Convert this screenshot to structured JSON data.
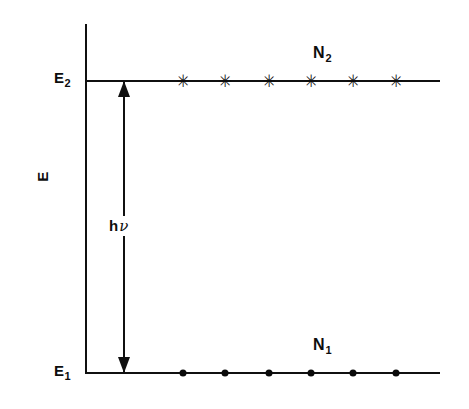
{
  "figure": {
    "background_color": "#ffffff",
    "ink_color": "#101010"
  },
  "axis": {
    "label": "E",
    "name": "energy-axis",
    "orientation": "vertical",
    "top_y": 24,
    "bottom_y": 373,
    "x": 86
  },
  "levels": [
    {
      "id": "upper",
      "level_label": "E",
      "level_subscript": "2",
      "population_label": "N",
      "population_subscript": "2",
      "marker_glyph": "✳",
      "marker_type": "asterisk",
      "y": 81,
      "x_start": 86,
      "x_end": 440,
      "marker_x": [
        183,
        225,
        269,
        311,
        353,
        396
      ]
    },
    {
      "id": "lower",
      "level_label": "E",
      "level_subscript": "1",
      "population_label": "N",
      "population_subscript": "1",
      "marker_glyph": "●",
      "marker_type": "dot",
      "y": 373,
      "x_start": 86,
      "x_end": 440,
      "marker_x": [
        183,
        225,
        269,
        311,
        353,
        396
      ]
    }
  ],
  "transition": {
    "label_h": "h",
    "label_nu": "ν",
    "label_full": "hν",
    "type": "double-headed-arrow",
    "x": 124,
    "from_y": 373,
    "to_y": 81
  },
  "chart_data": {
    "type": "scatter",
    "xlabel": "",
    "ylabel": "E",
    "grid": false,
    "legend": "none",
    "annotations": [
      "E2",
      "E1",
      "N2",
      "N1",
      "hν"
    ],
    "series": [
      {
        "name": "N2",
        "level": "E2",
        "marker": "asterisk",
        "count": 6,
        "x": [
          183,
          225,
          269,
          311,
          353,
          396
        ],
        "y": [
          81,
          81,
          81,
          81,
          81,
          81
        ]
      },
      {
        "name": "N1",
        "level": "E1",
        "marker": "dot",
        "count": 6,
        "x": [
          183,
          225,
          269,
          311,
          353,
          396
        ],
        "y": [
          373,
          373,
          373,
          373,
          373,
          373
        ]
      }
    ]
  }
}
